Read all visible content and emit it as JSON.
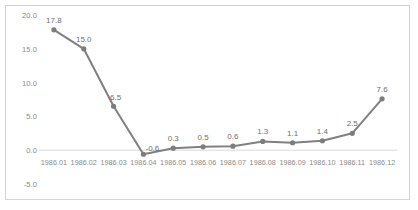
{
  "chart_data": {
    "type": "line",
    "title": "",
    "subtitle": "",
    "xlabel": "",
    "ylabel": "",
    "categories": [
      "1986.01",
      "1986.02",
      "1986.03",
      "1986.04",
      "1986.05",
      "1986.06",
      "1986.07",
      "1986.08",
      "1986.09",
      "1986.10",
      "1986.11",
      "1986.12"
    ],
    "values": [
      17.8,
      15.0,
      6.5,
      -0.6,
      0.3,
      0.5,
      0.6,
      1.3,
      1.1,
      1.4,
      2.5,
      7.6
    ],
    "point_labels": [
      "17.8",
      "15.0",
      "6.5",
      "-0.6",
      "0.3",
      "0.5",
      "0.6",
      "1.3",
      "1.1",
      "1.4",
      "2.5",
      "7.6"
    ],
    "series": [
      {
        "name": "",
        "values": [
          17.8,
          15.0,
          6.5,
          -0.6,
          0.3,
          0.5,
          0.6,
          1.3,
          1.1,
          1.4,
          2.5,
          7.6
        ]
      }
    ],
    "ylim": [
      -5.0,
      20.0
    ],
    "y_ticks": [
      20.0,
      15.0,
      10.0,
      5.0,
      0.0,
      -5.0
    ],
    "y_tick_labels": [
      "20.0",
      "15.0",
      "10.0",
      "5.0",
      "0.0",
      "-5.0"
    ],
    "grid": "zero-line-only",
    "legend": "none",
    "legend_position": "none",
    "marker": "circle",
    "colors": {
      "line": "#808080",
      "marker": "#7d7d7d",
      "zero_line": "#d9d9d9",
      "axis_text": "#8a8a8a",
      "label_text": "#6f6f6f",
      "border": "#d4d4d4",
      "background": "#ffffff"
    }
  }
}
